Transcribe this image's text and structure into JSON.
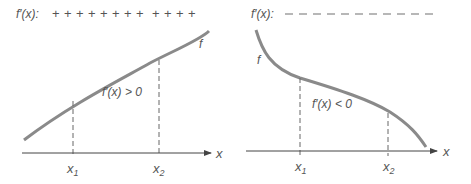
{
  "left_panel": {
    "sign_label": "f′(x):",
    "sign_marks": [
      "+",
      "+",
      "+",
      "+",
      "+",
      "+",
      "+",
      "+",
      "+",
      "+",
      "+",
      "+",
      "+"
    ],
    "curve_label": "f",
    "derivative_condition": "f′(x) > 0",
    "x_axis_label": "x",
    "ticks": [
      {
        "label": "x",
        "sub": "1"
      },
      {
        "label": "x",
        "sub": "2"
      }
    ]
  },
  "right_panel": {
    "sign_label": "f′(x):",
    "sign_marks": [
      "–",
      "–",
      "–",
      "–",
      "–",
      "–",
      "–",
      "–",
      "–",
      "–",
      "–",
      "–"
    ],
    "curve_label": "f",
    "derivative_condition": "f′(x) < 0",
    "x_axis_label": "x",
    "ticks": [
      {
        "label": "x",
        "sub": "1"
      },
      {
        "label": "x",
        "sub": "2"
      }
    ]
  },
  "colors": {
    "curve": "#8a8a8a",
    "axis": "#444444",
    "text": "#555555",
    "dashed": "#666666"
  }
}
